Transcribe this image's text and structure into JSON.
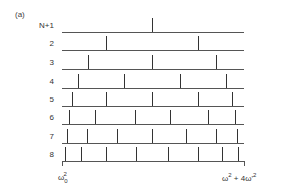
{
  "panel_label": "(a)",
  "rows": [
    {
      "label": "N+1",
      "y": 32,
      "ticks": [
        152
      ]
    },
    {
      "label": "2",
      "y": 50,
      "ticks": [
        106,
        198
      ]
    },
    {
      "label": "3",
      "y": 69,
      "ticks": [
        88,
        152,
        216
      ]
    },
    {
      "label": "4",
      "y": 88,
      "ticks": [
        78,
        124,
        180,
        226
      ]
    },
    {
      "label": "5",
      "y": 106,
      "ticks": [
        72,
        106,
        152,
        198,
        232
      ]
    },
    {
      "label": "6",
      "y": 124,
      "ticks": [
        69,
        95,
        135,
        170,
        208,
        235
      ]
    },
    {
      "label": "7",
      "y": 143,
      "ticks": [
        67,
        87,
        117,
        152,
        186,
        216,
        237
      ]
    },
    {
      "label": "8",
      "y": 161,
      "ticks": [
        65,
        81,
        106,
        136,
        168,
        198,
        222,
        238
      ]
    }
  ],
  "line": {
    "x_start": 62,
    "x_end": 244,
    "tick_height": 14
  },
  "axis": {
    "left_label": "ω₀²",
    "left_base": "ω",
    "left_sup": "2",
    "left_sub": "0",
    "right_label": "ω² + 4ω'²",
    "right_part1": "ω",
    "right_sup1": "2",
    "right_mid": " + 4ω'",
    "right_sup2": "2"
  }
}
